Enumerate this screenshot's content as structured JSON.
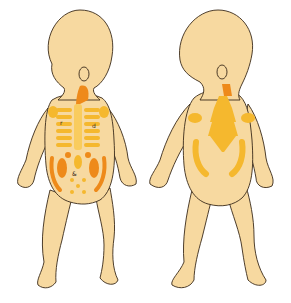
{
  "illustration": {
    "subject": "infant body diagram, front and back view with highlighted regions",
    "figures": [
      {
        "view": "front",
        "labels": [
          "r",
          "d",
          "&"
        ]
      },
      {
        "view": "back",
        "labels": []
      }
    ],
    "colors": {
      "skin": "#f7d9a0",
      "outline": "#3a2a1a",
      "highlight_light": "#f5b82e",
      "highlight_dark": "#ee8a1a",
      "background": "#ffffff"
    }
  }
}
